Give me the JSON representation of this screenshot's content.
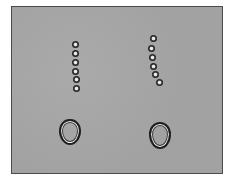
{
  "image": {
    "description": "Grayscale microscopy-like image with two vertical chains of six beads each and two ring-shaped objects below",
    "background_color": "#a4a4a4",
    "border_color": "#4a4a4a",
    "bead_chains": [
      {
        "name": "left-chain",
        "beads": [
          [
            75,
            44
          ],
          [
            75,
            53
          ],
          [
            75,
            62
          ],
          [
            75,
            71
          ],
          [
            76,
            79
          ],
          [
            76,
            88
          ]
        ]
      },
      {
        "name": "right-chain",
        "beads": [
          [
            153,
            38
          ],
          [
            151,
            48
          ],
          [
            152,
            57
          ],
          [
            153,
            66
          ],
          [
            155,
            74
          ],
          [
            159,
            82
          ]
        ]
      }
    ],
    "rings": [
      {
        "name": "left-ring",
        "cx": 70,
        "cy": 132,
        "w": 22,
        "h": 26
      },
      {
        "name": "right-ring",
        "cx": 160,
        "cy": 135,
        "w": 22,
        "h": 27
      }
    ]
  }
}
